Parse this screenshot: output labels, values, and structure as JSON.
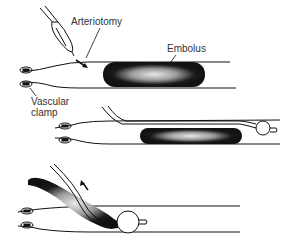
{
  "diagram": {
    "labels": {
      "arteriotomy": "Arteriotomy",
      "embolus": "Embolus",
      "vascular_clamp_line1": "Vascular",
      "vascular_clamp_line2": "clamp"
    },
    "panels": [
      {
        "step": 1,
        "description": "Scalpel makes arteriotomy proximal to embolus; vascular clamps in place"
      },
      {
        "step": 2,
        "description": "Balloon catheter passed beyond embolus and inflated"
      },
      {
        "step": 3,
        "description": "Inflated balloon withdrawn, extracting embolus through arteriotomy"
      }
    ],
    "colors": {
      "ink": "#111111",
      "background": "#ffffff",
      "embolus": "#1a1a1a"
    }
  }
}
